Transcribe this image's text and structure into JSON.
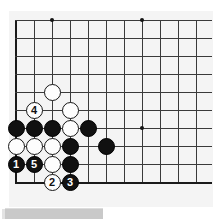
{
  "diagram": {
    "kind": "go-board-diagram",
    "title": "",
    "board": {
      "columns": 11,
      "rows": 10,
      "origin_x": 7,
      "origin_y": 9,
      "spacing": 18,
      "background_color": "#f4f4f4",
      "line_color": "#3a3a3a",
      "edge_color": "#1a1a1a",
      "edges": {
        "left": true,
        "bottom": true,
        "top": false,
        "right": false
      },
      "star_points": [
        {
          "col": 3,
          "row": 1
        },
        {
          "col": 8,
          "row": 1
        },
        {
          "col": 8,
          "row": 7
        }
      ]
    },
    "stones": [
      {
        "id": "w-a",
        "color": "white",
        "label": "",
        "col": 3,
        "row": 5
      },
      {
        "id": "w-b",
        "color": "white",
        "label": "4",
        "col": 2,
        "row": 6
      },
      {
        "id": "w-c",
        "color": "white",
        "label": "",
        "col": 4,
        "row": 6
      },
      {
        "id": "b-a",
        "color": "black",
        "label": "",
        "col": 1,
        "row": 7
      },
      {
        "id": "b-b",
        "color": "black",
        "label": "",
        "col": 2,
        "row": 7
      },
      {
        "id": "b-c",
        "color": "black",
        "label": "",
        "col": 3,
        "row": 7
      },
      {
        "id": "w-d",
        "color": "white",
        "label": "",
        "col": 4,
        "row": 7
      },
      {
        "id": "b-d",
        "color": "black",
        "label": "",
        "col": 5,
        "row": 7
      },
      {
        "id": "w-e",
        "color": "white",
        "label": "",
        "col": 1,
        "row": 8
      },
      {
        "id": "w-f",
        "color": "white",
        "label": "",
        "col": 2,
        "row": 8
      },
      {
        "id": "w-g",
        "color": "white",
        "label": "",
        "col": 3,
        "row": 8
      },
      {
        "id": "b-e",
        "color": "black",
        "label": "",
        "col": 4,
        "row": 8
      },
      {
        "id": "b-f",
        "color": "black",
        "label": "",
        "col": 6,
        "row": 8
      },
      {
        "id": "m1",
        "color": "black",
        "label": "1",
        "col": 1,
        "row": 9
      },
      {
        "id": "m5",
        "color": "black",
        "label": "5",
        "col": 2,
        "row": 9
      },
      {
        "id": "w-h",
        "color": "white",
        "label": "",
        "col": 3,
        "row": 9
      },
      {
        "id": "b-g",
        "color": "black",
        "label": "",
        "col": 4,
        "row": 9
      },
      {
        "id": "m2",
        "color": "white",
        "label": "2",
        "col": 3,
        "row": 10
      },
      {
        "id": "m3",
        "color": "black",
        "label": "3",
        "col": 4,
        "row": 10
      }
    ],
    "move_sequence": [
      {
        "number": "1",
        "color": "black"
      },
      {
        "number": "2",
        "color": "white"
      },
      {
        "number": "3",
        "color": "black"
      },
      {
        "number": "4",
        "color": "white"
      },
      {
        "number": "5",
        "color": "black"
      }
    ],
    "caption": {
      "text": "",
      "visible_partially": true
    },
    "colors": {
      "black_stone": "#111111",
      "white_stone": "#fdfdfd",
      "board_bg": "#f4f4f4",
      "caption_bg": "#c9c9c9"
    }
  }
}
